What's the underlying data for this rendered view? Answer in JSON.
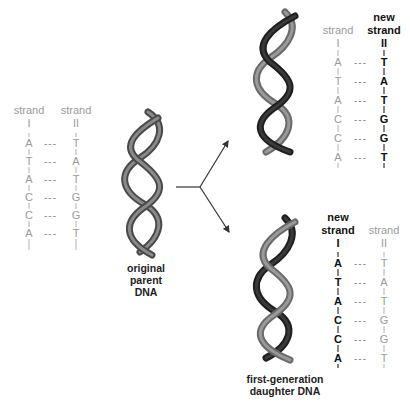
{
  "diagram": {
    "colors": {
      "parent_strand": "#9a9a9a",
      "new_strand": "#111111",
      "helix_light": "#6e6e6e",
      "helix_dark": "#2a2a2a",
      "arrow": "#333333"
    },
    "parent": {
      "caption": [
        "original",
        "parent",
        "DNA"
      ],
      "strand_I": {
        "header_top": "",
        "header": "strand",
        "numeral": "I",
        "bases": [
          "A",
          "T",
          "A",
          "C",
          "C",
          "A"
        ]
      },
      "strand_II": {
        "header_top": "",
        "header": "strand",
        "numeral": "II",
        "bases": [
          "T",
          "A",
          "T",
          "G",
          "G",
          "T"
        ]
      },
      "pair_marker": "---"
    },
    "daughter_top": {
      "strand_I": {
        "header_top": "",
        "header": "strand",
        "numeral": "I",
        "bases": [
          "A",
          "T",
          "A",
          "C",
          "C",
          "A"
        ],
        "new": false
      },
      "strand_II": {
        "header_top": "new",
        "header": "strand",
        "numeral": "II",
        "bases": [
          "T",
          "A",
          "T",
          "G",
          "G",
          "T"
        ],
        "new": true
      },
      "pair_marker": "---"
    },
    "daughter_bottom": {
      "strand_I": {
        "header_top": "new",
        "header": "strand",
        "numeral": "I",
        "bases": [
          "A",
          "T",
          "A",
          "C",
          "C",
          "A"
        ],
        "new": true
      },
      "strand_II": {
        "header_top": "",
        "header": "strand",
        "numeral": "II",
        "bases": [
          "T",
          "A",
          "T",
          "G",
          "G",
          "T"
        ],
        "new": false
      },
      "pair_marker": "---"
    },
    "daughter_caption": [
      "first-generation",
      "daughter DNA"
    ]
  }
}
